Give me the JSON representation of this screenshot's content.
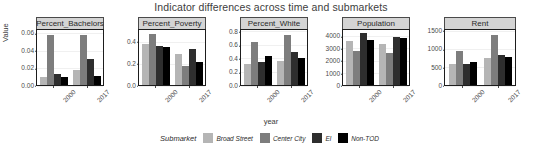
{
  "chart_data": {
    "type": "bar",
    "title": "Indicator differences across time and submarkets",
    "xlabel": "year",
    "ylabel": "Value",
    "grid": true,
    "legend_position": "bottom",
    "legend_title": "Submarket",
    "categories": [
      "2000",
      "2017"
    ],
    "series": [
      {
        "name": "Broad Street",
        "color": "#b5b5b5"
      },
      {
        "name": "Center City",
        "color": "#7d7d7d"
      },
      {
        "name": "El",
        "color": "#2e2e2e"
      },
      {
        "name": "Non-TOD",
        "color": "#000000"
      }
    ],
    "facets": [
      {
        "name": "Percent_Bachelors",
        "ylim": [
          0,
          0.065
        ],
        "yticks": [
          "0.00",
          "0.02",
          "0.04",
          "0.06"
        ],
        "ytick_values": [
          0,
          0.02,
          0.04,
          0.06
        ],
        "values": {
          "2000": [
            0.01,
            0.06,
            0.013,
            0.01
          ],
          "2017": [
            0.018,
            0.06,
            0.031,
            0.011
          ]
        }
      },
      {
        "name": "Percent_Poverty",
        "ylim": [
          0,
          0.52
        ],
        "yticks": [
          "0.0",
          "0.2",
          "0.4"
        ],
        "ytick_values": [
          0.0,
          0.2,
          0.4
        ],
        "values": {
          "2000": [
            0.39,
            0.49,
            0.37,
            0.36
          ],
          "2017": [
            0.3,
            0.18,
            0.35,
            0.22
          ]
        }
      },
      {
        "name": "Percent_White",
        "ylim": [
          0,
          0.84
        ],
        "yticks": [
          "0.0",
          "0.2",
          "0.4",
          "0.6",
          "0.8"
        ],
        "ytick_values": [
          0.0,
          0.2,
          0.4,
          0.6,
          0.8
        ],
        "values": {
          "2000": [
            0.32,
            0.67,
            0.36,
            0.45
          ],
          "2017": [
            0.37,
            0.78,
            0.51,
            0.42
          ]
        }
      },
      {
        "name": "Population",
        "ylim": [
          0,
          4600
        ],
        "yticks": [
          "0",
          "1000",
          "2000",
          "3000",
          "4000"
        ],
        "ytick_values": [
          0,
          1000,
          2000,
          3000,
          4000
        ],
        "values": {
          "2000": [
            3700,
            2900,
            4400,
            3800
          ],
          "2017": [
            3500,
            2700,
            4050,
            4000
          ]
        }
      },
      {
        "name": "Rent",
        "ylim": [
          0,
          1560
        ],
        "yticks": [
          "0",
          "500",
          "1000",
          "1500"
        ],
        "ytick_values": [
          0,
          500,
          1000,
          1500
        ],
        "values": {
          "2000": [
            600,
            990,
            610,
            650
          ],
          "2017": [
            780,
            1440,
            860,
            800
          ]
        }
      }
    ]
  }
}
